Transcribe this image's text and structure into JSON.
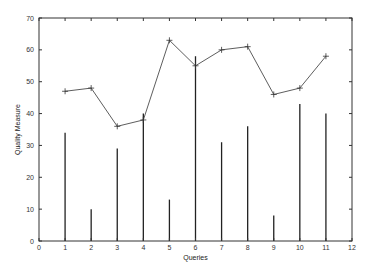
{
  "chart_data": {
    "type": "bar+line",
    "title": "",
    "xlabel": "Queries",
    "ylabel": "Quality Measure",
    "xlim": [
      0,
      12
    ],
    "ylim": [
      0,
      70
    ],
    "x_ticks": [
      0,
      1,
      2,
      3,
      4,
      5,
      6,
      7,
      8,
      9,
      10,
      11,
      12
    ],
    "y_ticks": [
      0,
      10,
      20,
      30,
      40,
      50,
      60,
      70
    ],
    "grid": false,
    "legend": null,
    "x": [
      1,
      2,
      3,
      4,
      5,
      6,
      7,
      8,
      9,
      10,
      11
    ],
    "series": [
      {
        "name": "impulses",
        "type": "bar",
        "style": "impulse",
        "values": [
          34,
          10,
          29,
          40,
          13,
          58,
          31,
          36,
          8,
          43,
          40
        ]
      },
      {
        "name": "linespoints",
        "type": "line",
        "marker": "plus",
        "values": [
          47,
          48,
          36,
          38,
          63,
          55,
          60,
          61,
          46,
          48,
          58
        ]
      }
    ]
  },
  "layout": {
    "plot_left": 39,
    "plot_right": 352,
    "plot_top": 18,
    "plot_bottom": 241
  },
  "colors": {
    "axis": "#333333",
    "bar": "#222222",
    "line": "#333333",
    "background": "#ffffff"
  }
}
